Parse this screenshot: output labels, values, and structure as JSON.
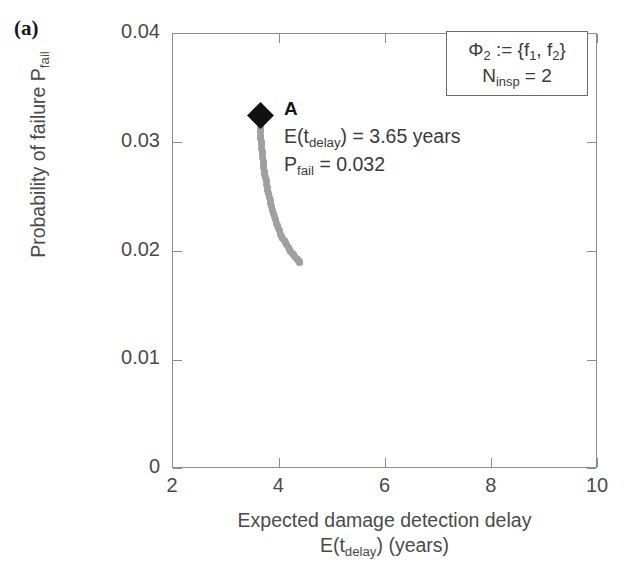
{
  "panel": {
    "label": "(a)"
  },
  "chart_data": {
    "type": "scatter",
    "title": "",
    "xlabel_line1": "Expected damage detection delay",
    "xlabel_line2_pre": "E(t",
    "xlabel_line2_sub": "delay",
    "xlabel_line2_post": ") (years)",
    "ylabel_pre": "Probability of failure P",
    "ylabel_sub": "fail",
    "xlim": [
      2,
      10
    ],
    "ylim": [
      0,
      0.04
    ],
    "xticks": [
      "2",
      "4",
      "6",
      "8",
      "10"
    ],
    "xtick_values": [
      2,
      4,
      6,
      8,
      10
    ],
    "yticks": [
      "0",
      "0.01",
      "0.02",
      "0.03",
      "0.04"
    ],
    "ytick_values": [
      0,
      0.01,
      0.02,
      0.03,
      0.04
    ],
    "grid": false,
    "legend_position": "top-right",
    "series": [
      {
        "name": "Pareto front",
        "marker": "circle",
        "color": "#a0a0a0",
        "x": [
          3.64,
          3.641,
          3.642,
          3.644,
          3.646,
          3.649,
          3.652,
          3.656,
          3.66,
          3.665,
          3.67,
          3.676,
          3.682,
          3.689,
          3.696,
          3.704,
          3.712,
          3.721,
          3.73,
          3.74,
          3.751,
          3.762,
          3.774,
          3.786,
          3.799,
          3.812,
          3.826,
          3.841,
          3.856,
          3.872,
          3.889,
          3.906,
          3.924,
          3.943,
          3.962,
          3.982,
          4.003,
          4.024,
          4.046,
          4.069,
          4.092,
          4.116,
          4.141,
          4.166,
          4.192,
          4.218,
          4.244,
          4.27,
          4.296,
          4.32,
          4.342,
          4.36,
          4.374,
          4.384,
          4.39
        ],
        "y": [
          0.0325,
          0.0322,
          0.0319,
          0.0316,
          0.0313,
          0.031,
          0.0307,
          0.0304,
          0.0301,
          0.0298,
          0.0295,
          0.0292,
          0.0289,
          0.0286,
          0.0283,
          0.028,
          0.0277,
          0.0274,
          0.0271,
          0.0268,
          0.0265,
          0.0262,
          0.0259,
          0.0256,
          0.0253,
          0.025,
          0.0247,
          0.0244,
          0.0241,
          0.0238,
          0.0235,
          0.0232,
          0.0229,
          0.0226,
          0.0224,
          0.0221,
          0.0219,
          0.0216,
          0.0214,
          0.0212,
          0.021,
          0.0208,
          0.0206,
          0.0204,
          0.0202,
          0.02,
          0.0198,
          0.0197,
          0.0195,
          0.0194,
          0.0193,
          0.0192,
          0.0191,
          0.019,
          0.019
        ]
      },
      {
        "name": "Solution A",
        "marker": "diamond",
        "color": "#111111",
        "x": [
          3.65
        ],
        "y": [
          0.0325
        ]
      }
    ]
  },
  "legend": {
    "line1_pre": "Φ",
    "line1_sub": "2",
    "line1_post_a": " := {f",
    "line1_sub_a": "1",
    "line1_mid": ", f",
    "line1_sub_b": "2",
    "line1_end": "}",
    "line2_pre": "N",
    "line2_sub": "insp",
    "line2_post": " = 2"
  },
  "annotation": {
    "point_label": "A",
    "line1_pre": "E(t",
    "line1_sub": "delay",
    "line1_post": ") = 3.65 years",
    "line2_pre": "P",
    "line2_sub": "fail",
    "line2_post": " = 0.032"
  },
  "colors": {
    "axis": "#8d8d8d",
    "text": "#4a4a4a",
    "marker": "#111111",
    "front": "#a0a0a0"
  }
}
